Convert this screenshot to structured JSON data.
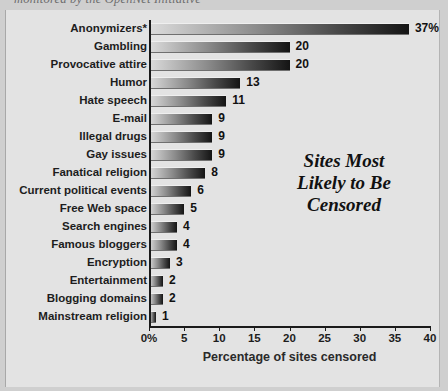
{
  "caption_fragment": "monitored by the OpenNet Initiative",
  "chart_title_lines": [
    "Sites Most",
    "Likely to Be",
    "Censored"
  ],
  "chart_data": {
    "type": "bar",
    "orientation": "horizontal",
    "xlabel": "Percentage of sites censored",
    "ylabel": "",
    "xlim": [
      0,
      40
    ],
    "xticks": [
      0,
      5,
      10,
      15,
      20,
      25,
      30,
      35,
      40
    ],
    "xtick_labels": [
      "0%",
      "5",
      "10",
      "15",
      "20",
      "25",
      "30",
      "35",
      "40"
    ],
    "grid": false,
    "legend": "none",
    "categories": [
      "Anonymizers*",
      "Gambling",
      "Provocative attire",
      "Humor",
      "Hate speech",
      "E-mail",
      "Illegal drugs",
      "Gay issues",
      "Fanatical religion",
      "Current political events",
      "Free Web space",
      "Search engines",
      "Famous bloggers",
      "Encryption",
      "Entertainment",
      "Blogging domains",
      "Mainstream religion"
    ],
    "values": [
      37,
      20,
      20,
      13,
      11,
      9,
      9,
      9,
      8,
      6,
      5,
      4,
      4,
      3,
      2,
      2,
      1
    ],
    "value_labels": [
      "37%",
      "20",
      "20",
      "13",
      "11",
      "9",
      "9",
      "9",
      "8",
      "6",
      "5",
      "4",
      "4",
      "3",
      "2",
      "2",
      "1"
    ],
    "bar_gradient": [
      "#dcdcdc",
      "#141414"
    ],
    "background_color": "#e3e3e3",
    "text_color": "#1d1d1d"
  }
}
